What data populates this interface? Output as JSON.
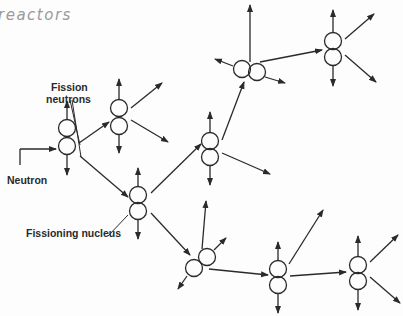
{
  "header": {
    "handwritten_text": "reactors"
  },
  "labels": {
    "fission_neutrons_line1": "Fission",
    "fission_neutrons_line2": "neutrons",
    "neutron": "Neutron",
    "fissioning_nucleus": "Fissioning nucleus"
  },
  "diagram": {
    "type": "chain-reaction",
    "stroke_color": "#2a2a2a",
    "nodes": [
      {
        "id": "n1",
        "x": 67,
        "y": 137,
        "tilt": 0
      },
      {
        "id": "n2",
        "x": 119,
        "y": 117,
        "tilt": 0
      },
      {
        "id": "n3",
        "x": 138,
        "y": 200,
        "tilt": 0
      },
      {
        "id": "n4",
        "x": 210,
        "y": 140,
        "tilt": 0
      },
      {
        "id": "n5",
        "x": 248,
        "y": 71,
        "tilt": 90
      },
      {
        "id": "n6",
        "x": 333,
        "y": 49,
        "tilt": 0
      },
      {
        "id": "n7",
        "x": 198,
        "y": 264,
        "tilt": -60
      },
      {
        "id": "n8",
        "x": 278,
        "y": 277,
        "tilt": 0
      },
      {
        "id": "n9",
        "x": 358,
        "y": 273,
        "tilt": 0
      }
    ]
  }
}
